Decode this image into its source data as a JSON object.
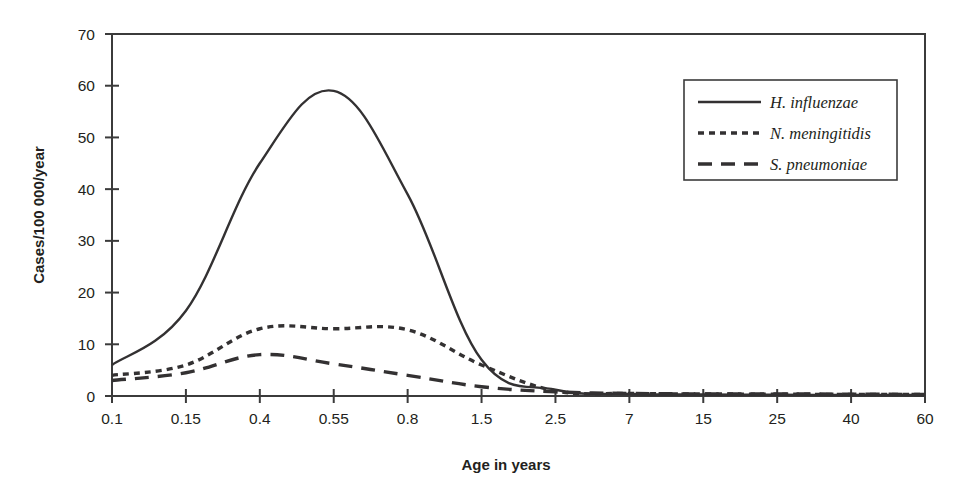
{
  "figure": {
    "background_color": "#ffffff",
    "line_color": "#333132",
    "axis_color": "#3b3b3b"
  },
  "chart_data": {
    "type": "line",
    "title": "",
    "subtitle": "",
    "xlabel": "Age in years",
    "ylabel": "Cases/100 000/year",
    "x_tick_labels": [
      "0.1",
      "0.15",
      "0.4",
      "0.55",
      "0.8",
      "1.5",
      "2.5",
      "7",
      "15",
      "25",
      "40",
      "60"
    ],
    "x_scale": "categorical-ordinal",
    "y_ticks": [
      0,
      10,
      20,
      30,
      40,
      50,
      60,
      70
    ],
    "y_tick_labels": [
      "0",
      "10",
      "20",
      "30",
      "40",
      "50",
      "60",
      "70"
    ],
    "ylim": [
      0,
      70
    ],
    "grid": false,
    "legend_position": "top-right",
    "legend_entries": [
      {
        "label": "H. influenzae",
        "style": "solid"
      },
      {
        "label": "N. meningitidis",
        "style": "dotted"
      },
      {
        "label": "S. pneumoniae",
        "style": "dashed"
      }
    ],
    "series": [
      {
        "name": "H. influenzae",
        "style": "solid",
        "x": [
          "0.1",
          "0.15",
          "0.4",
          "0.55",
          "0.8",
          "1.5",
          "2.5",
          "7",
          "15",
          "25",
          "40",
          "60"
        ],
        "values": [
          6.0,
          16.5,
          45.0,
          59.0,
          39.0,
          7.0,
          1.2,
          0.4,
          0.3,
          0.25,
          0.2,
          0.2
        ]
      },
      {
        "name": "N. meningitidis",
        "style": "dotted",
        "x": [
          "0.1",
          "0.15",
          "0.4",
          "0.55",
          "0.8",
          "1.5",
          "2.5",
          "7",
          "15",
          "25",
          "40",
          "60"
        ],
        "values": [
          4.0,
          6.0,
          13.0,
          13.0,
          12.8,
          6.0,
          1.0,
          0.5,
          0.4,
          0.35,
          0.3,
          0.3
        ]
      },
      {
        "name": "S. pneumoniae",
        "style": "dashed",
        "x": [
          "0.1",
          "0.15",
          "0.4",
          "0.55",
          "0.8",
          "1.5",
          "2.5",
          "7",
          "15",
          "25",
          "40",
          "60"
        ],
        "values": [
          3.0,
          4.5,
          8.0,
          6.2,
          4.0,
          1.8,
          0.8,
          0.5,
          0.4,
          0.4,
          0.35,
          0.3
        ]
      }
    ]
  }
}
